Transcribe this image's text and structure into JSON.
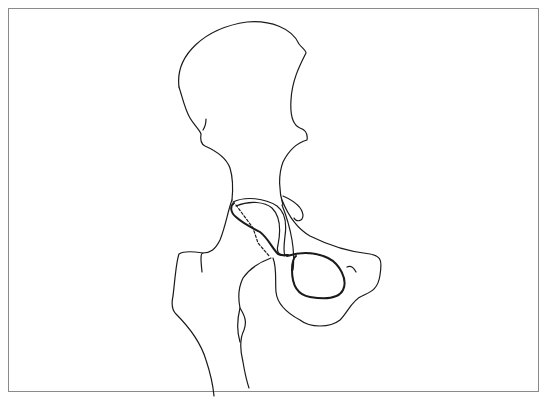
{
  "figure": {
    "parts": [
      {
        "id": "ilium",
        "label": "Ilium"
      },
      {
        "id": "acetabulum",
        "label": "Acetabulum / femoral head"
      },
      {
        "id": "obturator-foramen",
        "label": "Obturator foramen"
      },
      {
        "id": "ischium-pubis",
        "label": "Ischiopubic ramus"
      },
      {
        "id": "femur",
        "label": "Proximal femur"
      },
      {
        "id": "femoral-neck-line",
        "label": "Femoral neck dashed line"
      }
    ],
    "colors": {
      "stroke": "#1a1a1a",
      "frame": "#8a8a8a",
      "background": "#ffffff"
    }
  }
}
